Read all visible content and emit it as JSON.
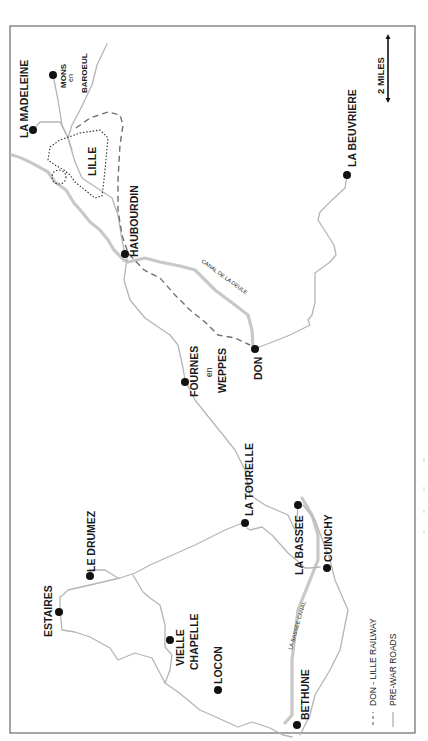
{
  "map": {
    "title": "",
    "scale_bar": {
      "label": "2 MILES"
    },
    "legend": [
      {
        "symbol": "dashed-line",
        "label": "DON - LILLE RAILWAY",
        "color": "#707070"
      },
      {
        "symbol": "solid-line",
        "label": "PRE-WAR ROADS",
        "color": "#b5b5b5"
      }
    ],
    "places": {
      "la_madeleine": "LA MADELEINE",
      "mons": {
        "line1": "MONS",
        "line2": "en",
        "line3": "BAROEUL"
      },
      "lille": "LILLE",
      "haubourdin": "HAUBOURDIN",
      "la_beuvriere": "LA BEUVRIERE",
      "fournes": {
        "line1": "FOURNES",
        "line2": "en",
        "line3": "WEPPES"
      },
      "don": "DON",
      "la_tourelle": "LA TOURELLE",
      "la_bassee": "LA BASSEE",
      "cuinchy": "CUINCHY",
      "le_drumez": "LE DRUMEZ",
      "estaires": "ESTAIRES",
      "vielle_chapelle": {
        "line1": "VIELLE",
        "line2": "CHAPELLE"
      },
      "locon": "LOCON",
      "bethune": "BETHUNE"
    },
    "waterways": {
      "canal_de_la_deule": "CANAL DE LA DEULE",
      "la_bassee_canal": "LA BASSEE CANAL"
    },
    "colors": {
      "frame": "#6a6a6a",
      "road": "#b5b5b5",
      "canal": "#c8c8c8",
      "railway": "#707070",
      "town_marker": "#111111"
    }
  }
}
